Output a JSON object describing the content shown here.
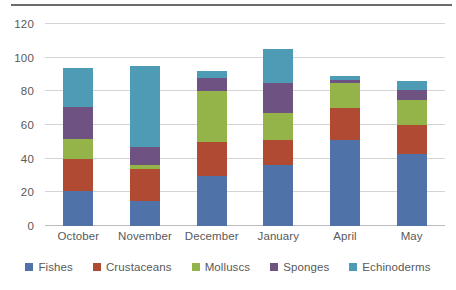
{
  "chart_data": {
    "type": "bar",
    "subtype": "stacked-bar",
    "title": "",
    "xlabel": "",
    "ylabel": "",
    "ylim": [
      0,
      120
    ],
    "ytick_step": 20,
    "yticks": [
      0,
      20,
      40,
      60,
      80,
      100,
      120
    ],
    "ytick_labels": [
      "0",
      "20",
      "40",
      "60",
      "80",
      "100",
      "120"
    ],
    "grid": true,
    "grid_axis": "y",
    "legend_position": "bottom",
    "categories": [
      "October",
      "November",
      "December",
      "January",
      "April",
      "May"
    ],
    "series": [
      {
        "name": "Fishes",
        "color": "#4F72A8",
        "values": [
          21,
          15,
          30,
          36,
          51,
          43
        ]
      },
      {
        "name": "Crustaceans",
        "color": "#B14A33",
        "values": [
          19,
          19,
          20,
          15,
          19,
          17
        ]
      },
      {
        "name": "Molluscs",
        "color": "#94B44A",
        "values": [
          12,
          2,
          30,
          16,
          15,
          15
        ]
      },
      {
        "name": "Sponges",
        "color": "#6D5282",
        "values": [
          19,
          11,
          8,
          18,
          2,
          6
        ]
      },
      {
        "name": "Echinoderms",
        "color": "#4E9BB5",
        "values": [
          23,
          48,
          4,
          20,
          2,
          5
        ]
      }
    ],
    "totals": [
      94,
      95,
      92,
      105,
      89,
      86
    ]
  },
  "legend": {
    "items": [
      {
        "label": "Fishes",
        "color": "#4F72A8"
      },
      {
        "label": "Crustaceans",
        "color": "#B14A33"
      },
      {
        "label": "Molluscs",
        "color": "#94B44A"
      },
      {
        "label": "Sponges",
        "color": "#6D5282"
      },
      {
        "label": "Echinoderms",
        "color": "#4E9BB5"
      }
    ]
  },
  "colors": {
    "gridline": "#d4d4d4",
    "tick_text": "#595959",
    "top_rule": "#6b6b6b",
    "background": "#ffffff"
  }
}
